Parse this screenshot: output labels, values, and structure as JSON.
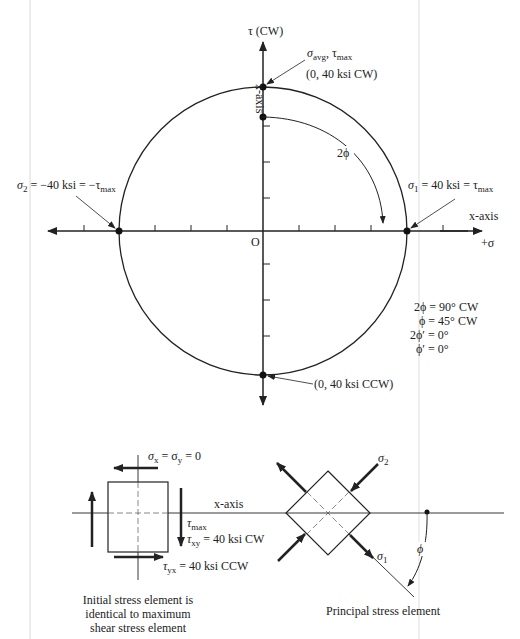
{
  "mohr_circle": {
    "tau_axis_label": "τ (CW)",
    "vertical_axis_label": "x-axis",
    "horizontal_axis_label": "x-axis",
    "sigma_axis_label": "+σ",
    "origin_label": "O",
    "center": [
      263,
      231
    ],
    "radius": 144,
    "tick_spacing_px": 36,
    "points": {
      "top": {
        "label_line1_a": "σ",
        "label_line1_a_sub": "avg",
        "label_line1_b": ", τ",
        "label_line1_b_sub": "max",
        "label_line2": "(0, 40 ksi CW)"
      },
      "bottom": {
        "label": "(0, 40 ksi CCW)"
      },
      "right": {
        "label_sigma": "σ",
        "label_sigma_sub": "1",
        "label_mid": " = 40 ksi = τ",
        "label_tau_sub": "max"
      },
      "left": {
        "label_sigma": "σ",
        "label_sigma_sub": "2",
        "label_mid": " = −40 ksi = −τ",
        "label_tau_sub": "max"
      }
    },
    "angle_label": "2ϕ",
    "angles": [
      "2ϕ = 90° CW",
      "ϕ = 45° CW",
      "2ϕ′ = 0°",
      "ϕ′ = 0°"
    ]
  },
  "initial_element": {
    "normal_stress_label": "σ",
    "normal_stress_sub_x": "x",
    "normal_stress_eq": " = σ",
    "normal_stress_sub_y": "y",
    "normal_stress_val": " = 0",
    "axis_label": "x-axis",
    "tau_max_sym": "τ",
    "tau_max_sub": "max",
    "tau_xy_sym": "τ",
    "tau_xy_sub": "xy",
    "tau_xy_val": " = 40 ksi CW",
    "tau_yx_sym": "τ",
    "tau_yx_sub": "yx",
    "tau_yx_val": " = 40 ksi CCW",
    "caption": [
      "Initial stress element is",
      "identical to maximum",
      "shear stress element"
    ]
  },
  "principal_element": {
    "sigma1_sym": "σ",
    "sigma1_sub": "1",
    "sigma2_sym": "σ",
    "sigma2_sub": "2",
    "angle_label": "ϕ",
    "caption": "Principal stress element"
  }
}
